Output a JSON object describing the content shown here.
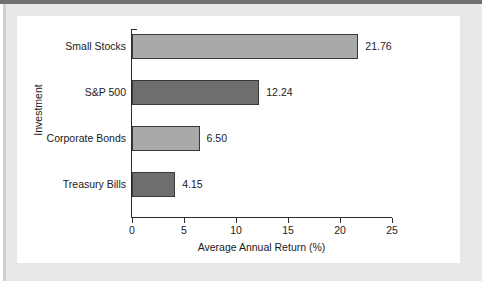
{
  "chart_data": {
    "type": "bar",
    "orientation": "horizontal",
    "title": "",
    "xlabel": "Average Annual Return (%)",
    "ylabel": "Investment",
    "categories": [
      "Small Stocks",
      "S&P 500",
      "Corporate Bonds",
      "Treasury Bills"
    ],
    "values": [
      21.76,
      12.24,
      6.5,
      4.15
    ],
    "value_labels": [
      "21.76",
      "12.24",
      "6.50",
      "4.15"
    ],
    "xlim": [
      0,
      25
    ],
    "xticks": [
      0,
      5,
      10,
      15,
      20,
      25
    ],
    "xtick_labels": [
      "0",
      "5",
      "10",
      "15",
      "20",
      "25"
    ],
    "grid": false,
    "legend": "none",
    "bar_colors": [
      "#a9a9a9",
      "#6e6e6e",
      "#a9a9a9",
      "#6e6e6e"
    ],
    "bar_edge_color": "#3a3a3a",
    "axis_color": "#2b2b2b",
    "plot_background": "#ffffff",
    "frame_color": "#e8e8e8",
    "top_rule_color": "#6f7175"
  }
}
